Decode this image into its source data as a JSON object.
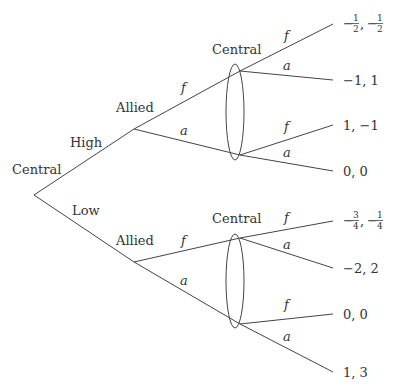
{
  "diagram": {
    "type": "extensive-form game tree",
    "root": {
      "player": "Central"
    },
    "root_moves": [
      {
        "label": "High"
      },
      {
        "label": "Low"
      }
    ],
    "allied_nodes": [
      {
        "player": "Allied",
        "moves": [
          {
            "label": "f"
          },
          {
            "label": "a"
          }
        ]
      },
      {
        "player": "Allied",
        "moves": [
          {
            "label": "f"
          },
          {
            "label": "a"
          }
        ]
      }
    ],
    "information_sets": [
      {
        "player": "Central",
        "branches": [
          {
            "label": "f",
            "payoff": "−1/2, −1/2"
          },
          {
            "label": "a",
            "payoff": "−1, 1"
          },
          {
            "label": "f",
            "payoff": "1, −1"
          },
          {
            "label": "a",
            "payoff": "0, 0"
          }
        ]
      },
      {
        "player": "Central",
        "branches": [
          {
            "label": "f",
            "payoff": "−3/4, −1/4"
          },
          {
            "label": "a",
            "payoff": "−2, 2"
          },
          {
            "label": "f",
            "payoff": "0, 0"
          },
          {
            "label": "a",
            "payoff": "1, 3"
          }
        ]
      }
    ],
    "text": {
      "root_player": "Central",
      "high": "High",
      "low": "Low",
      "allied_top": "Allied",
      "allied_bottom": "Allied",
      "central_top": "Central",
      "central_bottom": "Central",
      "f": "f",
      "a": "a",
      "minus": "−",
      "one": "1",
      "two": "2",
      "three": "3",
      "four": "4",
      "comma": ",",
      "pay_top_2": "−1, 1",
      "pay_top_3": "1, −1",
      "pay_top_4": "0, 0",
      "pay_bot_2": "−2, 2",
      "pay_bot_3": "0, 0",
      "pay_bot_4": "1, 3"
    }
  }
}
